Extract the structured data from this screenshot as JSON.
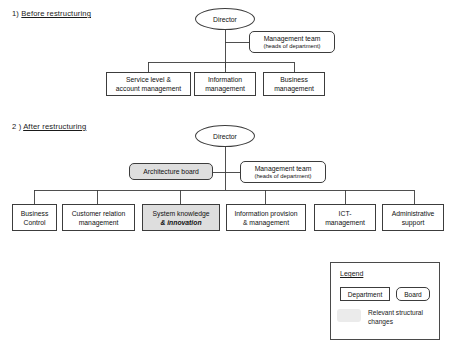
{
  "document": {
    "title": "Organisation restructuring diagram"
  },
  "colors": {
    "line": "#3c3c3c",
    "shaded_fill": "#dedede",
    "legend_swatch": "#ebebeb",
    "background": "#ffffff",
    "text": "#1a1a1a"
  },
  "sections": [
    {
      "id": "before",
      "number": "1)",
      "title": "Before restructuring",
      "root": {
        "label": "Director",
        "shape": "ellipse"
      },
      "side": {
        "label_line1": "Management team",
        "label_line2": "(heads of department)",
        "shape": "board"
      },
      "departments": [
        {
          "line1": "Service level &",
          "line2": "account management",
          "shape": "department",
          "shaded": false
        },
        {
          "line1": "Information",
          "line2": "management",
          "shape": "department",
          "shaded": false
        },
        {
          "line1": "Business",
          "line2": "management",
          "shape": "department",
          "shaded": false
        }
      ]
    },
    {
      "id": "after",
      "number": "2 )",
      "title": "After restructuring",
      "root": {
        "label": "Director",
        "shape": "ellipse"
      },
      "board_left": {
        "label": "Architecture board",
        "shape": "board",
        "shaded": true
      },
      "side": {
        "label_line1": "Management team",
        "label_line2": "(heads of department)",
        "shape": "board"
      },
      "departments": [
        {
          "line1": "Business",
          "line2": "Control",
          "shape": "department",
          "shaded": false
        },
        {
          "line1": "Customer relation",
          "line2": "management",
          "shape": "department",
          "shaded": false
        },
        {
          "line1": "System knowledge",
          "line2": "& innovation",
          "line2_style": "bold-italic",
          "shape": "department",
          "shaded": true
        },
        {
          "line1": "Information provision",
          "line2": "& management",
          "shape": "department",
          "shaded": false
        },
        {
          "line1": "ICT-",
          "line2": "management",
          "shape": "department",
          "shaded": false
        },
        {
          "line1": "Administrative",
          "line2": "support",
          "shape": "department",
          "shaded": false
        }
      ]
    }
  ],
  "legend": {
    "title": "Legend",
    "items": [
      {
        "label": "Department",
        "shape": "department"
      },
      {
        "label": "Board",
        "shape": "board"
      }
    ],
    "note_line1": "Relevant structural",
    "note_line2": "changes",
    "note_swatch": "shaded-fill"
  }
}
